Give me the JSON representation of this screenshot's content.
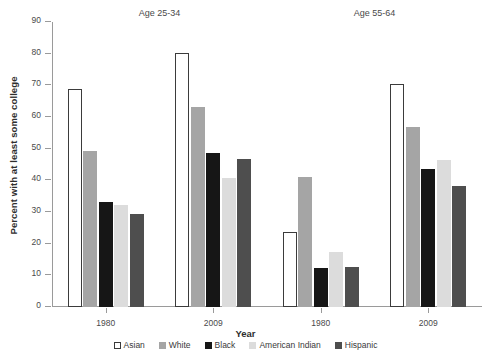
{
  "chart_data": {
    "type": "bar",
    "title": "",
    "xlabel": "Year",
    "ylabel": "Percent with at least some college",
    "ylim": [
      0,
      90
    ],
    "yticks": [
      0,
      10,
      20,
      30,
      40,
      50,
      60,
      70,
      80,
      90
    ],
    "grid": false,
    "legend_position": "bottom",
    "panels": [
      {
        "title": "Age 25-34",
        "categories": [
          "1980",
          "2009"
        ],
        "series": [
          {
            "name": "Asian",
            "values": [
              69.0,
              80.2
            ]
          },
          {
            "name": "White",
            "values": [
              49.2,
              63.2
            ]
          },
          {
            "name": "Black",
            "values": [
              33.2,
              48.7
            ]
          },
          {
            "name": "American Indian",
            "values": [
              32.3,
              40.8
            ]
          },
          {
            "name": "Hispanic",
            "values": [
              29.5,
              46.6
            ]
          }
        ]
      },
      {
        "title": "Age 55-64",
        "categories": [
          "1980",
          "2009"
        ],
        "series": [
          {
            "name": "Asian",
            "values": [
              23.7,
              70.3
            ]
          },
          {
            "name": "White",
            "values": [
              41.0,
              57.0
            ]
          },
          {
            "name": "Black",
            "values": [
              12.4,
              43.6
            ]
          },
          {
            "name": "American Indian",
            "values": [
              17.5,
              46.5
            ]
          },
          {
            "name": "Hispanic",
            "values": [
              12.6,
              38.1
            ]
          }
        ]
      }
    ],
    "colors": {
      "Asian": "#ffffff",
      "White": "#a5a5a5",
      "Black": "#161616",
      "American Indian": "#dcdcdc",
      "Hispanic": "#4e4e4e"
    }
  },
  "legend": {
    "items": [
      {
        "label": "Asian",
        "key": "asian"
      },
      {
        "label": "White",
        "key": "white"
      },
      {
        "label": "Black",
        "key": "black"
      },
      {
        "label": "American Indian",
        "key": "amindian"
      },
      {
        "label": "Hispanic",
        "key": "hispanic"
      }
    ]
  }
}
